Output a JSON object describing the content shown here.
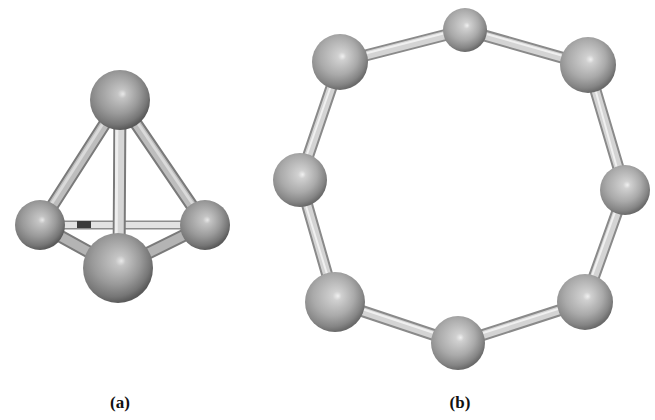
{
  "figure": {
    "panels": [
      {
        "id": "a",
        "label": "(a)",
        "structure": "tetrahedron",
        "atom_count": 4,
        "atoms": [
          {
            "name": "top",
            "cx": 120,
            "cy": 100,
            "r": 30
          },
          {
            "name": "left",
            "cx": 40,
            "cy": 225,
            "r": 25
          },
          {
            "name": "right",
            "cx": 205,
            "cy": 225,
            "r": 25
          },
          {
            "name": "bottom-front",
            "cx": 118,
            "cy": 268,
            "r": 35
          }
        ],
        "bonds": [
          [
            "top",
            "left"
          ],
          [
            "top",
            "right"
          ],
          [
            "top",
            "bottom-front"
          ],
          [
            "left",
            "right"
          ],
          [
            "left",
            "bottom-front"
          ],
          [
            "right",
            "bottom-front"
          ]
        ]
      },
      {
        "id": "b",
        "label": "(b)",
        "structure": "8-membered ring",
        "atom_count": 8,
        "atoms": [
          {
            "name": "top",
            "cx": 465,
            "cy": 30,
            "r": 22
          },
          {
            "name": "upper-right",
            "cx": 588,
            "cy": 65,
            "r": 28
          },
          {
            "name": "right",
            "cx": 625,
            "cy": 190,
            "r": 25
          },
          {
            "name": "lower-right",
            "cx": 585,
            "cy": 302,
            "r": 28
          },
          {
            "name": "bottom",
            "cx": 458,
            "cy": 343,
            "r": 27
          },
          {
            "name": "lower-left",
            "cx": 335,
            "cy": 302,
            "r": 30
          },
          {
            "name": "left",
            "cx": 300,
            "cy": 180,
            "r": 27
          },
          {
            "name": "upper-left",
            "cx": 340,
            "cy": 62,
            "r": 28
          }
        ]
      }
    ],
    "colors": {
      "atom_base": "#8a8a8a",
      "atom_highlight": "#d8d8d8",
      "atom_shadow": "#4a4a4a",
      "bond_fill": "#dcdcdc",
      "bond_edge": "#8c8c8c",
      "background": "#ffffff"
    }
  }
}
